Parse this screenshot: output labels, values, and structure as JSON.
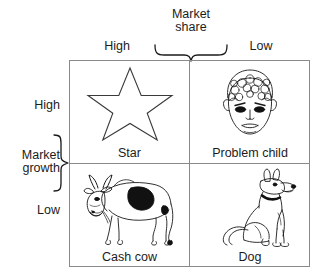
{
  "diagram": {
    "type": "bcg-growth-share-matrix",
    "axes": {
      "horizontal": {
        "title_line1": "Market",
        "title_line2": "share",
        "left_label": "High",
        "right_label": "Low",
        "brace": "downward-curly-brace"
      },
      "vertical": {
        "title_line1": "Market",
        "title_line2": "growth",
        "top_label": "High",
        "bottom_label": "Low",
        "brace": "rightward-curly-brace"
      }
    },
    "quadrants": [
      {
        "id": "star",
        "label": "Star",
        "icon": "star-icon",
        "market_share": "High",
        "market_growth": "High",
        "position": "top-left"
      },
      {
        "id": "problem-child",
        "label": "Problem child",
        "icon": "child-face-icon",
        "market_share": "Low",
        "market_growth": "High",
        "position": "top-right"
      },
      {
        "id": "cash-cow",
        "label": "Cash cow",
        "icon": "cow-icon",
        "market_share": "High",
        "market_growth": "Low",
        "position": "bottom-left"
      },
      {
        "id": "dog",
        "label": "Dog",
        "icon": "dog-icon",
        "market_share": "Low",
        "market_growth": "Low",
        "position": "bottom-right"
      }
    ],
    "colors": {
      "background": "#ffffff",
      "grid_line": "#8a8a8a",
      "text": "#1c1c1c",
      "art_stroke": "#1a1a1a",
      "art_fill": "#111111"
    }
  }
}
